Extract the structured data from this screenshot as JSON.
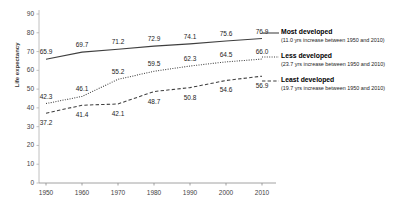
{
  "chart_data": {
    "type": "line",
    "title": "",
    "xlabel": "",
    "ylabel": "Life expectancy",
    "x": [
      1950,
      1960,
      1970,
      1980,
      1990,
      2000,
      2010
    ],
    "categories": [
      "1950",
      "1960",
      "1970",
      "1980",
      "1990",
      "2000",
      "2010"
    ],
    "ylim": [
      0,
      90
    ],
    "yticks": [
      0,
      10,
      20,
      30,
      40,
      50,
      60,
      70,
      80,
      90
    ],
    "ytick_labels": [
      "0",
      "10",
      "20",
      "30",
      "40",
      "50",
      "60",
      "70",
      "80",
      "90"
    ],
    "grid": false,
    "legend_position": "right",
    "series": [
      {
        "name": "Most developed",
        "note": "(11.0 yrs increase between 1950 and 2010)",
        "line_style": "solid",
        "color": "#3f3f3f",
        "values": [
          65.9,
          69.7,
          71.2,
          72.9,
          74.1,
          75.6,
          76.9
        ],
        "labels": [
          "65.9",
          "69.7",
          "71.2",
          "72.9",
          "74.1",
          "75.6",
          "76.9"
        ]
      },
      {
        "name": "Less developed",
        "note": "(23.7 yrs increase between 1950 and 2010)",
        "line_style": "dotted",
        "color": "#3f3f3f",
        "values": [
          42.3,
          46.1,
          55.2,
          59.5,
          62.3,
          64.5,
          66.0
        ],
        "labels": [
          "42.3",
          "46.1",
          "55.2",
          "59.5",
          "62.3",
          "64.5",
          "66.0"
        ]
      },
      {
        "name": "Least developed",
        "note": "(19.7 yrs increase between 1950 and 2010)",
        "line_style": "dashed",
        "color": "#3f3f3f",
        "values": [
          37.2,
          41.4,
          42.1,
          48.7,
          50.8,
          54.6,
          56.9
        ],
        "labels": [
          "37.2",
          "41.4",
          "42.1",
          "48.7",
          "50.8",
          "54.6",
          "56.9"
        ]
      }
    ]
  },
  "axis": {
    "y_title": "Life expectancy"
  },
  "legend": {
    "items": [
      {
        "title": "Most developed",
        "note": "(11.0 yrs increase between 1950 and 2010)"
      },
      {
        "title": "Less developed",
        "note": "(23.7 yrs increase between 1950 and 2010)"
      },
      {
        "title": "Least developed",
        "note": "(19.7 yrs increase between 1950 and 2010)"
      }
    ]
  }
}
